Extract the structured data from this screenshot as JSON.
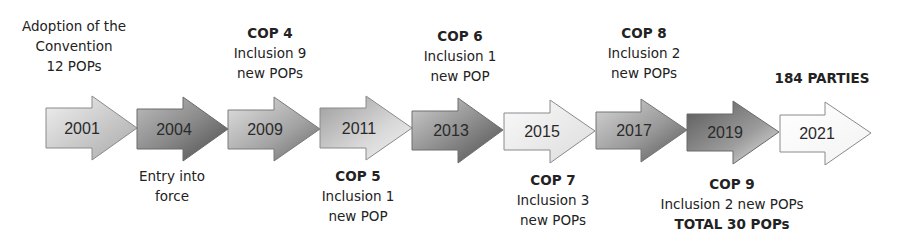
{
  "milestones": [
    {
      "year": "2001",
      "style": "light-to-mid",
      "top": {
        "lines": [
          "Adoption of the",
          "Convention",
          "12 POPs"
        ],
        "bold": ""
      }
    },
    {
      "year": "2004",
      "style": "dark",
      "bottom": {
        "lines": [
          "Entry into",
          "force"
        ],
        "bold": ""
      }
    },
    {
      "year": "2009",
      "style": "mid",
      "top": {
        "bold": "COP 4",
        "lines": [
          "Inclusion 9",
          "new POPs"
        ]
      }
    },
    {
      "year": "2011",
      "style": "mid-to-light",
      "bottom": {
        "bold": "COP 5",
        "lines": [
          "Inclusion 1",
          "new POP"
        ]
      }
    },
    {
      "year": "2013",
      "style": "dark-mid",
      "top": {
        "bold": "COP 6",
        "lines": [
          "Inclusion 1",
          "new POP"
        ]
      }
    },
    {
      "year": "2015",
      "style": "light",
      "bottom": {
        "bold": "COP 7",
        "lines": [
          "Inclusion 3",
          "new POPs"
        ]
      }
    },
    {
      "year": "2017",
      "style": "mid-to-dark",
      "top": {
        "bold": "COP 8",
        "lines": [
          "Inclusion 2",
          "new POPs"
        ]
      }
    },
    {
      "year": "2019",
      "style": "darkest",
      "bottom": {
        "bold": "COP 9",
        "lines": [
          "Inclusion 2 new POPs"
        ],
        "bold_footer": "TOTAL 30 POPs"
      }
    },
    {
      "year": "2021",
      "style": "white",
      "top": {
        "bold": "184 PARTIES",
        "lines": []
      }
    }
  ],
  "labels": {
    "m0_top_1": "Adoption of the",
    "m0_top_2": "Convention",
    "m0_top_3": "12 POPs",
    "m1_bottom_1": "Entry into",
    "m1_bottom_2": "force",
    "m2_top_bold": "COP 4",
    "m2_top_1": "Inclusion 9",
    "m2_top_2": "new POPs",
    "m3_bottom_bold": "COP 5",
    "m3_bottom_1": "Inclusion 1",
    "m3_bottom_2": "new POP",
    "m4_top_bold": "COP 6",
    "m4_top_1": "Inclusion 1",
    "m4_top_2": "new POP",
    "m5_bottom_bold": "COP 7",
    "m5_bottom_1": "Inclusion 3",
    "m5_bottom_2": "new POPs",
    "m6_top_bold": "COP 8",
    "m6_top_1": "Inclusion 2",
    "m6_top_2": "new POPs",
    "m7_bottom_bold": "COP 9",
    "m7_bottom_1": "Inclusion 2 new POPs",
    "m7_bottom_footer": "TOTAL 30 POPs",
    "m8_top_bold": "184 PARTIES"
  },
  "colors": {
    "stroke": "#8a8a8a",
    "text": "#222222",
    "light": "#f2f2f2",
    "mid": "#b5b5b5",
    "dark": "#6e6e6e",
    "darkest": "#555555",
    "white": "#fbfbfb"
  }
}
